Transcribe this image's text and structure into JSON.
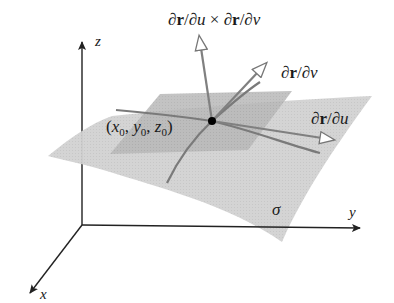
{
  "diagram": {
    "axes": {
      "x_label": "x",
      "y_label": "y",
      "z_label": "z"
    },
    "surface": {
      "label": "σ",
      "color": "#cfcfcf",
      "tangent_plane_color": "#b4b4b4"
    },
    "point": {
      "label": "(x₀, y₀, z₀)",
      "parts": [
        "(",
        "x",
        "0",
        ", ",
        "y",
        "0",
        ", ",
        "z",
        "0",
        ")"
      ]
    },
    "vectors": [
      {
        "name": "normal",
        "label": "∂r/∂u × ∂r/∂v"
      },
      {
        "name": "r_v",
        "label": "∂r/∂v"
      },
      {
        "name": "r_u",
        "label": "∂r/∂u"
      }
    ],
    "labels": {
      "normal": {
        "d1": "∂",
        "r1": "r",
        "s1": "/∂",
        "u": "u",
        "times": " × ∂",
        "r2": "r",
        "s2": "/∂",
        "v": "v"
      },
      "r_v": {
        "d": "∂",
        "r": "r",
        "s": "/∂",
        "v": "v"
      },
      "r_u": {
        "d": "∂",
        "r": "r",
        "s": "/∂",
        "u": "u"
      }
    },
    "colors": {
      "axis": "#222222",
      "curve": "#7a7a7a",
      "vector": "#808080",
      "point": "#000000"
    }
  }
}
